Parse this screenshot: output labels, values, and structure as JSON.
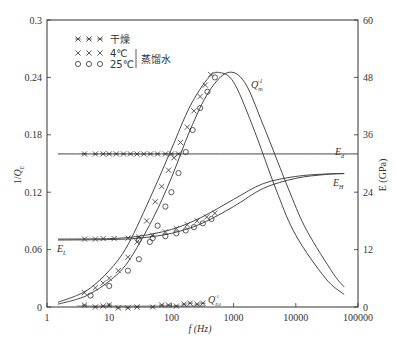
{
  "chart_data": {
    "type": "line",
    "title": "",
    "xlabel": "f (Hz)",
    "ylabel_left": "1/Q_E",
    "ylabel_right": "E (GPa)",
    "x_scale": "log",
    "xlim": [
      1,
      100000
    ],
    "ylim_left": [
      0,
      0.3
    ],
    "ylim_right": [
      0,
      60
    ],
    "x_ticks": [
      "1",
      "10",
      "100",
      "1000",
      "10000",
      "100000"
    ],
    "y_ticks_left": [
      "0",
      "0.06",
      "0.12",
      "0.18",
      "0.24",
      "0.3"
    ],
    "y_ticks_right": [
      "0",
      "12",
      "24",
      "36",
      "48",
      "60"
    ],
    "grid": false,
    "legend": {
      "position": "upper-left",
      "entries": [
        {
          "marker": "asterisk",
          "label": "干燥"
        },
        {
          "marker": "x",
          "label": "4℃"
        },
        {
          "marker": "circle",
          "label": "25℃"
        }
      ],
      "group_label": "蒸馏水"
    },
    "annotations": [
      "Q_m^-1",
      "E_d",
      "E_H",
      "E_L",
      "Q_Ed^-1"
    ],
    "series": [
      {
        "name": "Q_m^-1 (4℃ model)",
        "axis": "left",
        "x": [
          1.5,
          3,
          5,
          10,
          20,
          50,
          100,
          200,
          400,
          600,
          1000,
          2000,
          5000,
          10000,
          30000,
          60000
        ],
        "y": [
          0.005,
          0.012,
          0.02,
          0.038,
          0.065,
          0.12,
          0.165,
          0.21,
          0.24,
          0.245,
          0.235,
          0.19,
          0.12,
          0.075,
          0.03,
          0.013
        ]
      },
      {
        "name": "Q_m^-1 (25℃ model)",
        "axis": "left",
        "x": [
          1.5,
          3,
          5,
          10,
          20,
          50,
          100,
          200,
          400,
          800,
          1500,
          3000,
          8000,
          15000,
          40000,
          60000
        ],
        "y": [
          0.003,
          0.008,
          0.014,
          0.027,
          0.047,
          0.092,
          0.135,
          0.185,
          0.225,
          0.245,
          0.235,
          0.19,
          0.12,
          0.08,
          0.035,
          0.021
        ]
      },
      {
        "name": "4℃ 1/Q_E data",
        "axis": "left",
        "marker": "x",
        "x": [
          4,
          6,
          8,
          10,
          14,
          20,
          28,
          40,
          55,
          70,
          90,
          110,
          140,
          180,
          230,
          290,
          350,
          430
        ],
        "y": [
          0.015,
          0.02,
          0.025,
          0.03,
          0.038,
          0.052,
          0.068,
          0.09,
          0.11,
          0.126,
          0.143,
          0.156,
          0.172,
          0.188,
          0.205,
          0.22,
          0.232,
          0.243
        ]
      },
      {
        "name": "25℃ 1/Q_E data",
        "axis": "left",
        "marker": "circle",
        "x": [
          5,
          10,
          20,
          30,
          45,
          60,
          80,
          100,
          130,
          170,
          220,
          290,
          380,
          500
        ],
        "y": [
          0.012,
          0.022,
          0.038,
          0.05,
          0.068,
          0.085,
          0.105,
          0.12,
          0.14,
          0.162,
          0.185,
          0.208,
          0.225,
          0.24
        ]
      },
      {
        "name": "E_d (dry)",
        "axis": "right",
        "x": [
          1.5,
          100000
        ],
        "y": [
          32,
          32
        ]
      },
      {
        "name": "Dry E data",
        "axis": "right",
        "marker": "asterisk",
        "x": [
          4,
          6,
          8,
          10,
          13,
          17,
          22,
          28,
          36,
          46,
          60,
          80,
          100,
          130
        ],
        "y": [
          32,
          32,
          32,
          32,
          32,
          32,
          32,
          32,
          32,
          32,
          32,
          32,
          32,
          32
        ]
      },
      {
        "name": "E (4℃ model)",
        "axis": "right",
        "x": [
          1.5,
          10,
          30,
          100,
          300,
          1000,
          3000,
          10000,
          30000,
          60000
        ],
        "y": [
          14.2,
          14.3,
          14.8,
          16.2,
          18.7,
          22.5,
          25.8,
          27.3,
          27.8,
          27.9
        ]
      },
      {
        "name": "E (25℃ model)",
        "axis": "right",
        "x": [
          1.5,
          10,
          30,
          100,
          300,
          1000,
          3000,
          10000,
          30000,
          60000
        ],
        "y": [
          14.0,
          14.1,
          14.4,
          15.4,
          17.4,
          21.0,
          24.8,
          26.9,
          27.7,
          27.9
        ]
      },
      {
        "name": "4℃ E data",
        "axis": "right",
        "marker": "x",
        "x": [
          4,
          6,
          8,
          12,
          20,
          30,
          50,
          80,
          120,
          180,
          260,
          370,
          500
        ],
        "y": [
          14.2,
          14.2,
          14.3,
          14.3,
          14.4,
          14.6,
          15.0,
          15.7,
          16.4,
          17.2,
          18.0,
          18.8,
          19.6
        ]
      },
      {
        "name": "25℃ E data",
        "axis": "right",
        "marker": "circle",
        "x": [
          30,
          50,
          80,
          120,
          170,
          230,
          320,
          440
        ],
        "y": [
          14.1,
          14.4,
          14.8,
          15.4,
          16.0,
          16.7,
          17.5,
          18.4
        ]
      },
      {
        "name": "Q_Ed^-1 (dry)",
        "axis": "left",
        "marker": "asterisk",
        "x": [
          4,
          6,
          8,
          10,
          14,
          20,
          28,
          50,
          70,
          90,
          120,
          160,
          200,
          260,
          320
        ],
        "y": [
          0.002,
          0.0,
          0.001,
          0.002,
          -0.001,
          -0.001,
          0.0,
          0.0,
          0.002,
          0.002,
          0.001,
          0.003,
          0.004,
          0.003,
          0.004
        ]
      }
    ]
  },
  "labels": {
    "legend_dry": "干燥",
    "legend_4c": "4℃",
    "legend_25c": "25℃",
    "legend_group": "蒸馏水",
    "qm": "Q",
    "qm_sub": "m",
    "qm_sup": "-1",
    "ed": "E",
    "ed_sub": "d",
    "eh": "E",
    "eh_sub": "H",
    "el": "E",
    "el_sub": "L",
    "qed": "Q",
    "qed_sub": "Ed",
    "qed_sup": "-1",
    "ylabel_left_prefix": "1/",
    "ylabel_left_q": "Q",
    "ylabel_left_sub": "E",
    "ylabel_right": "E (GPa)",
    "xlabel": "f (Hz)"
  },
  "plot_box": {
    "left": 47,
    "right": 358,
    "top": 20,
    "bottom": 307
  }
}
